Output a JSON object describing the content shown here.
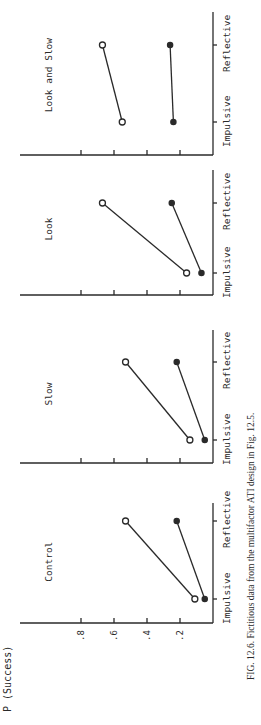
{
  "figure": {
    "caption": "FIG. 12.6.   Fictitious data from the multifactor ATI design in Fig. 12.5.",
    "ylabel": "P (Success)",
    "orientation": "rotated-90-ccw"
  },
  "chart_data": [
    {
      "type": "line",
      "title": "Control",
      "xlabel": "",
      "ylabel": "P (Success)",
      "categories": [
        "Impulsive",
        "Reflective"
      ],
      "yticks": [
        ".2",
        ".4",
        ".6",
        ".8"
      ],
      "ylim": [
        0,
        1.0
      ],
      "series": [
        {
          "name": "open",
          "marker": "open-circle",
          "values": [
            0.11,
            0.53
          ]
        },
        {
          "name": "filled",
          "marker": "filled-circle",
          "values": [
            0.05,
            0.22
          ]
        }
      ]
    },
    {
      "type": "line",
      "title": "Slow",
      "categories": [
        "Impulsive",
        "Reflective"
      ],
      "ylim": [
        0,
        1.0
      ],
      "series": [
        {
          "name": "open",
          "marker": "open-circle",
          "values": [
            0.14,
            0.53
          ]
        },
        {
          "name": "filled",
          "marker": "filled-circle",
          "values": [
            0.05,
            0.22
          ]
        }
      ]
    },
    {
      "type": "line",
      "title": "Look",
      "categories": [
        "Impulsive",
        "Reflective"
      ],
      "ylim": [
        0,
        1.0
      ],
      "series": [
        {
          "name": "open",
          "marker": "open-circle",
          "values": [
            0.16,
            0.67
          ]
        },
        {
          "name": "filled",
          "marker": "filled-circle",
          "values": [
            0.07,
            0.25
          ]
        }
      ]
    },
    {
      "type": "line",
      "title": "Look and Slow",
      "categories": [
        "Impulsive",
        "Reflective"
      ],
      "ylim": [
        0,
        1.0
      ],
      "series": [
        {
          "name": "open",
          "marker": "open-circle",
          "values": [
            0.55,
            0.67
          ]
        },
        {
          "name": "filled",
          "marker": "filled-circle",
          "values": [
            0.24,
            0.26
          ]
        }
      ]
    }
  ],
  "layout": {
    "baseline_x": 213,
    "px_per_unit": 165,
    "panels": [
      {
        "top": 503,
        "bottom": 613,
        "impulsive_y": 599,
        "reflective_y": 521,
        "title_y": 560
      },
      {
        "top": 330,
        "bottom": 453,
        "impulsive_y": 440,
        "reflective_y": 362,
        "title_y": 393
      },
      {
        "top": 170,
        "bottom": 285,
        "impulsive_y": 273,
        "reflective_y": 203,
        "title_y": 228
      },
      {
        "top": 12,
        "bottom": 145,
        "impulsive_y": 122,
        "reflective_y": 45,
        "title_y": 72
      }
    ],
    "left_axis_panel_index": 0,
    "y_axis_line_y": 623
  }
}
